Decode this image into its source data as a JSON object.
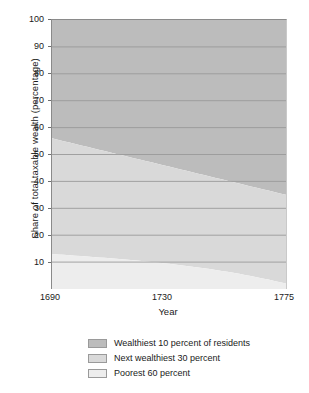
{
  "chart_data": {
    "type": "area",
    "title": "",
    "subtitle": "",
    "xlabel": "Year",
    "ylabel": "Share of total taxable wealth (percentage)",
    "stacked": true,
    "grid": true,
    "grid_orientation": "horizontal",
    "legend_position": "bottom",
    "xlim": [
      1690,
      1775
    ],
    "ylim": [
      0,
      100
    ],
    "xticks": [
      1690,
      1730,
      1775
    ],
    "xticklabels": [
      "1690",
      "1730",
      "1775"
    ],
    "yticks": [
      10,
      20,
      30,
      40,
      50,
      60,
      70,
      80,
      90,
      100
    ],
    "yticklabels": [
      "10",
      "20",
      "30",
      "40",
      "50",
      "60",
      "70",
      "80",
      "90",
      "100"
    ],
    "x": [
      1690,
      1775
    ],
    "series": [
      {
        "name": "Poorest 60 percent",
        "color": "#ededed",
        "values": [
          13,
          2
        ]
      },
      {
        "name": "Next wealthiest 30 percent",
        "color": "#d9d9d9",
        "values": [
          43,
          33
        ]
      },
      {
        "name": "Wealthiest 10 percent of residents",
        "color": "#bcbcbc",
        "values": [
          44,
          65
        ]
      }
    ],
    "cumulative_boundaries": {
      "poorest_60_top": [
        13,
        2
      ],
      "next_30_top": [
        56,
        35
      ],
      "total_top": [
        100,
        100
      ]
    }
  },
  "axes": {
    "y_title": "Share of total taxable wealth (percentage)",
    "x_title": "Year",
    "y_ticks": [
      "100",
      "90",
      "80",
      "70",
      "60",
      "50",
      "40",
      "30",
      "20",
      "10"
    ],
    "x_ticks": [
      "1690",
      "1730",
      "1775"
    ]
  },
  "legend": {
    "items": [
      {
        "label": "Wealthiest 10 percent of residents",
        "color": "#bcbcbc"
      },
      {
        "label": "Next wealthiest 30 percent",
        "color": "#d9d9d9"
      },
      {
        "label": "Poorest 60 percent",
        "color": "#ededed"
      }
    ]
  },
  "colors": {
    "wealthiest_10": "#bcbcbc",
    "next_30": "#d9d9d9",
    "poorest_60": "#ededed",
    "gridline": "#9a9a9a",
    "axis": "#8a8a8a",
    "background": "#ffffff",
    "text": "#1a1a1a"
  }
}
